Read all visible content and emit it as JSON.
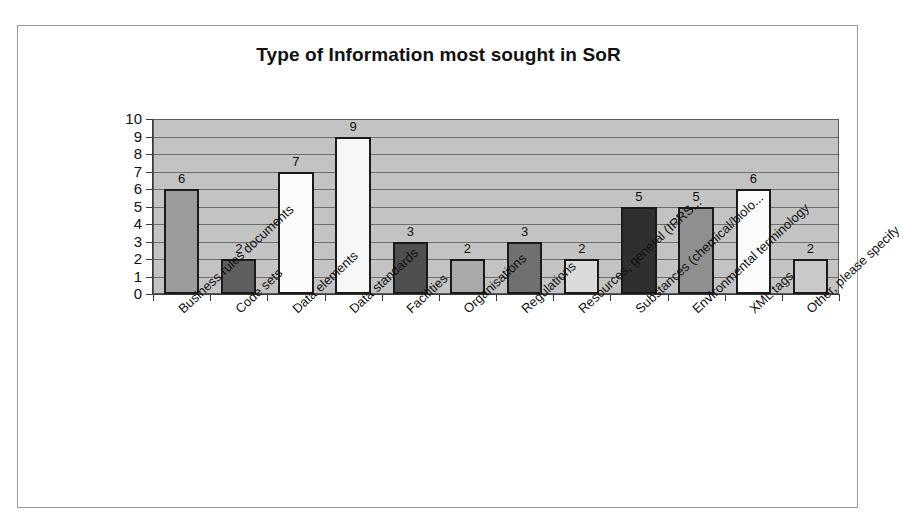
{
  "chart_data": {
    "type": "bar",
    "title": "Type of Information most sought in SoR",
    "xlabel": "",
    "ylabel": "",
    "ylim": [
      0,
      10
    ],
    "ytick_labels": [
      "10",
      "9",
      "8",
      "7",
      "6",
      "5",
      "4",
      "3",
      "2",
      "1",
      "0"
    ],
    "grid": true,
    "legend": "none",
    "categories": [
      "Business rules documents",
      "Code sets",
      "Data elements",
      "Data standards",
      "Facilities",
      "Organisations",
      "Regulations",
      "Resources, general (IRRS...",
      "Substances (chemical/biolo...",
      "Environmental terminology",
      "XML tags",
      "Other, please specify"
    ],
    "values": [
      6,
      2,
      7,
      9,
      3,
      2,
      3,
      2,
      5,
      5,
      6,
      2
    ],
    "bar_colors": [
      "#9c9c9c",
      "#5f5f5f",
      "#fbfbfb",
      "#f7f7f7",
      "#4f4f4f",
      "#a9a9a9",
      "#707070",
      "#dadada",
      "#2f2f2f",
      "#8f8f8f",
      "#fbfbfb",
      "#c9c9c9"
    ],
    "plot_background": "#c3c3c3",
    "gridline_color": "#6e6e6e",
    "bar_outline_color": "#1a1a1a",
    "axis_color": "#3a3a3a",
    "frame_border_color": "#9a9a9a",
    "text_color": "#111111"
  }
}
